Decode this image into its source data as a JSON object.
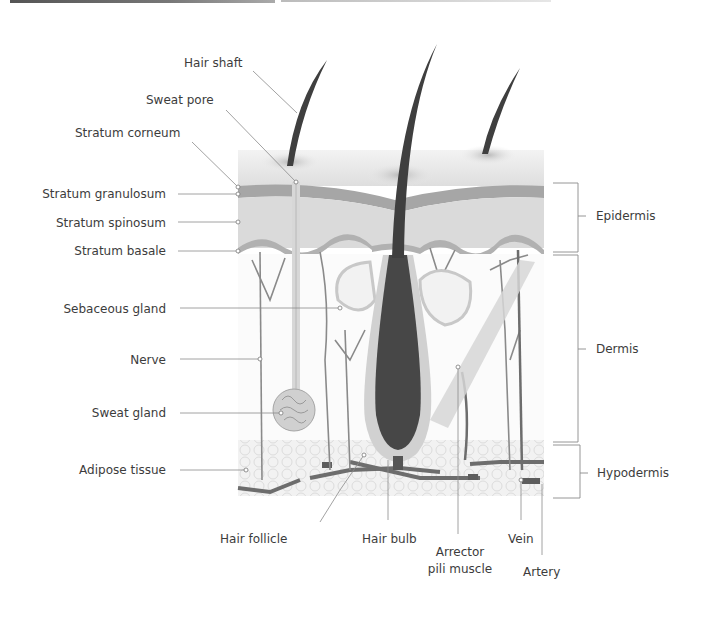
{
  "diagram": {
    "left_labels": [
      {
        "id": "stratum-granulosum",
        "text": "Stratum granulosum"
      },
      {
        "id": "stratum-spinosum",
        "text": "Stratum spinosum"
      },
      {
        "id": "stratum-basale",
        "text": "Stratum basale"
      },
      {
        "id": "sebaceous-gland",
        "text": "Sebaceous gland"
      },
      {
        "id": "nerve",
        "text": "Nerve"
      },
      {
        "id": "sweat-gland",
        "text": "Sweat gland"
      },
      {
        "id": "adipose-tissue",
        "text": "Adipose tissue"
      }
    ],
    "top_labels": [
      {
        "id": "hair-shaft",
        "text": "Hair shaft"
      },
      {
        "id": "sweat-pore",
        "text": "Sweat pore"
      },
      {
        "id": "stratum-corneum",
        "text": "Stratum corneum"
      }
    ],
    "bottom_labels": [
      {
        "id": "hair-follicle",
        "text": "Hair follicle"
      },
      {
        "id": "hair-bulb",
        "text": "Hair bulb"
      },
      {
        "id": "arrector-pili-muscle",
        "line1": "Arrector",
        "line2": "pili muscle"
      },
      {
        "id": "vein",
        "text": "Vein"
      },
      {
        "id": "artery",
        "text": "Artery"
      }
    ],
    "layer_brackets": [
      {
        "id": "epidermis",
        "text": "Epidermis"
      },
      {
        "id": "dermis",
        "text": "Dermis"
      },
      {
        "id": "hypodermis",
        "text": "Hypodermis"
      }
    ],
    "colors": {
      "hair": "#3f3f3f",
      "epidermis_band": "#a9a9a9",
      "epidermis_fill": "#d8d8d8",
      "surface": "#e9e9e9",
      "structure_light": "#cfcfcf",
      "leader_line": "#8a8a8a",
      "vessel": "#6d6d6d"
    }
  }
}
